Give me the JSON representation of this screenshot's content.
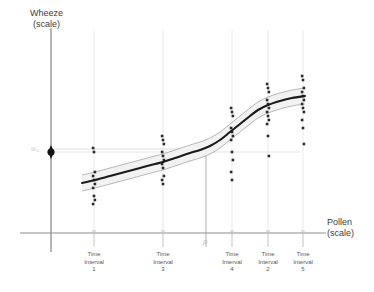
{
  "figure": {
    "background": "#ffffff",
    "axis_color": "#8e8e8e",
    "curve_color": "#1a1a1a",
    "band_color": "#9a9a9a",
    "point_color": "#2b2b2b",
    "guide_color": "#bdbdbd"
  },
  "axes": {
    "y_title_line1": "Wheeze",
    "y_title_line2": "(scale)",
    "x_title_line1": "Pollen",
    "x_title_line2": "(scale)"
  },
  "annotations": {
    "intercept_marker_label": "w₀",
    "threshold_label": "p"
  },
  "chart_data": {
    "type": "scatter",
    "title": "",
    "xlabel": "Pollen (scale)",
    "ylabel": "Wheeze (scale)",
    "grid": false,
    "legend": "none",
    "xlim": [
      0,
      374
    ],
    "ylim": [
      0,
      292
    ],
    "x_ticks": [
      94,
      163,
      232,
      268,
      303
    ],
    "tick_labels": [
      "Time Interval 1",
      "Time Interval 3",
      "Time Interval 4",
      "Time Interval 2",
      "Time Interval 5"
    ],
    "tick_label_lines": [
      [
        "Time",
        "Interval",
        "1"
      ],
      [
        "Time",
        "Interval",
        "3"
      ],
      [
        "Time",
        "Interval",
        "4"
      ],
      [
        "Time",
        "Interval",
        "2"
      ],
      [
        "Time",
        "Interval",
        "5"
      ]
    ],
    "threshold_x": 206,
    "intercept_y": 152,
    "fit_curve": [
      [
        82,
        183
      ],
      [
        95,
        180
      ],
      [
        110,
        176
      ],
      [
        125,
        172
      ],
      [
        140,
        168
      ],
      [
        155,
        164
      ],
      [
        163,
        162
      ],
      [
        175,
        158
      ],
      [
        190,
        153
      ],
      [
        200,
        150
      ],
      [
        210,
        146
      ],
      [
        220,
        140
      ],
      [
        230,
        132
      ],
      [
        240,
        124
      ],
      [
        250,
        116
      ],
      [
        258,
        110
      ],
      [
        268,
        105
      ],
      [
        280,
        101
      ],
      [
        292,
        98
      ],
      [
        305,
        96
      ]
    ],
    "band_upper_offset": -8,
    "band_lower_offset": 8,
    "series": [
      {
        "name": "Time Interval 1",
        "x": 94,
        "y_values": [
          148,
          152,
          172,
          176,
          180,
          184,
          188,
          196,
          200,
          204
        ]
      },
      {
        "name": "Time Interval 3",
        "x": 163,
        "y_values": [
          136,
          140,
          144,
          152,
          156,
          160,
          164,
          168,
          176,
          180,
          184
        ]
      },
      {
        "name": "Time Interval 4",
        "x": 232,
        "y_values": [
          108,
          112,
          116,
          128,
          132,
          136,
          140,
          152,
          160,
          172,
          180
        ]
      },
      {
        "name": "Time Interval 2",
        "x": 268,
        "y_values": [
          84,
          88,
          92,
          100,
          104,
          108,
          112,
          116,
          120,
          124,
          136,
          156
        ]
      },
      {
        "name": "Time Interval 5",
        "x": 303,
        "y_values": [
          76,
          80,
          88,
          92,
          96,
          100,
          104,
          108,
          112,
          120,
          128,
          144
        ]
      }
    ]
  }
}
